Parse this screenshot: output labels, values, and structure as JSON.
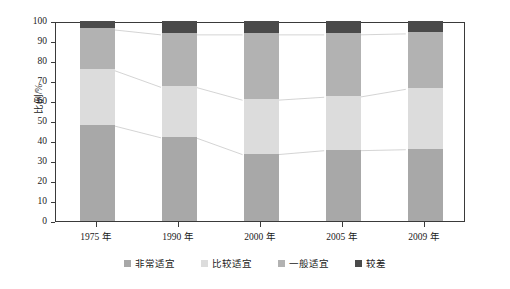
{
  "chart_data": {
    "type": "bar",
    "subtype": "stacked-percentage",
    "title": "",
    "xlabel": "",
    "ylabel": "比例/%",
    "ylim": [
      0,
      100
    ],
    "ytick_step": 10,
    "yticks": [
      0,
      10,
      20,
      30,
      40,
      50,
      60,
      70,
      80,
      90,
      100
    ],
    "grid": false,
    "legend_position": "bottom",
    "categories": [
      "1975 年",
      "1990 年",
      "2000 年",
      "2005 年",
      "2009 年"
    ],
    "series": [
      {
        "name": "非常适宜",
        "color": "#a8a8a8",
        "values": [
          48.0,
          42.0,
          33.5,
          35.5,
          36.0
        ]
      },
      {
        "name": "比较适宜",
        "color": "#dcdcdc",
        "values": [
          28.0,
          25.5,
          27.5,
          27.0,
          30.5
        ]
      },
      {
        "name": "一般适宜",
        "color": "#b2b2b2",
        "values": [
          20.5,
          26.5,
          33.0,
          31.5,
          28.0
        ]
      },
      {
        "name": "较差",
        "color": "#4a4a4a",
        "values": [
          3.5,
          6.0,
          6.0,
          6.0,
          5.5
        ]
      }
    ],
    "cumulative_boundaries": [
      [
        48.0,
        76.0,
        96.5
      ],
      [
        42.0,
        67.5,
        94.0
      ],
      [
        33.5,
        61.0,
        94.0
      ],
      [
        35.5,
        62.5,
        94.0
      ],
      [
        36.0,
        66.5,
        94.5
      ]
    ],
    "connector_lines": true
  },
  "legend": {
    "items": [
      {
        "label": "非常适宜",
        "color": "#a8a8a8"
      },
      {
        "label": "比较适宜",
        "color": "#dcdcdc"
      },
      {
        "label": "一般适宜",
        "color": "#b2b2b2"
      },
      {
        "label": "较差",
        "color": "#4a4a4a"
      }
    ]
  },
  "axes": {
    "y_label": "比例/%",
    "y_tick_labels": [
      "0",
      "10",
      "20",
      "30",
      "40",
      "50",
      "60",
      "70",
      "80",
      "90",
      "100"
    ],
    "x_tick_labels": [
      "1975 年",
      "1990 年",
      "2000 年",
      "2005 年",
      "2009 年"
    ]
  },
  "colors": {
    "frame": "#3a3a3a",
    "text": "#1a1a1a",
    "background": "#ffffff",
    "connector": "#c9c9c9"
  }
}
